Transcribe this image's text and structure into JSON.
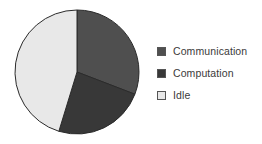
{
  "chart_data": {
    "type": "pie",
    "title": "",
    "categories": [
      "Communication",
      "Computation",
      "Idle"
    ],
    "values": [
      31,
      24,
      45
    ],
    "value_unit": "percent",
    "angles_deg": [
      111,
      86,
      163
    ],
    "start_angle_deg": 0,
    "direction": "clockwise",
    "colors": [
      "#4f4f4f",
      "#383838",
      "#e8e8e8"
    ],
    "slice_outline_color": "#2b2b2b",
    "legend_position": "right",
    "grid": false,
    "xlabel": "",
    "ylabel": "",
    "labels_on_slices": false
  },
  "legend": {
    "items": [
      {
        "label": "Communication",
        "color": "#4f4f4f",
        "swatch_name": "swatch-communication"
      },
      {
        "label": "Computation",
        "color": "#383838",
        "swatch_name": "swatch-computation"
      },
      {
        "label": "Idle",
        "color": "#e8e8e8",
        "swatch_name": "swatch-idle"
      }
    ]
  },
  "pie": {
    "center_x": 77,
    "center_y": 72,
    "radius": 62
  }
}
